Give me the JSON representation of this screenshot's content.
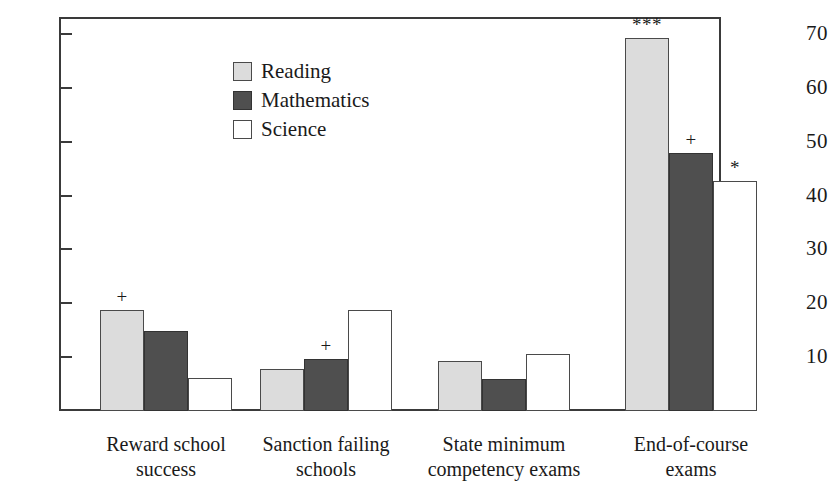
{
  "chart_data": {
    "type": "bar",
    "title": "",
    "subtitle": "",
    "xlabel": "",
    "ylabel": "",
    "ylim": [
      0,
      73
    ],
    "yticks": [
      10,
      20,
      30,
      40,
      50,
      60,
      70
    ],
    "grid": false,
    "legend_position": "inside-top-left",
    "categories": [
      "Reward school success",
      "Sanction failing schools",
      "State minimum competency exams",
      "End-of-course exams"
    ],
    "category_lines": [
      [
        "Reward school",
        "success"
      ],
      [
        "Sanction failing",
        "schools"
      ],
      [
        "State minimum",
        "competency exams"
      ],
      [
        "End-of-course",
        "exams"
      ]
    ],
    "series": [
      {
        "name": "Reading",
        "color": "#dcdcdc",
        "values": [
          18.8,
          7.8,
          9.3,
          69.3
        ],
        "annotations": [
          "+",
          "",
          "",
          "***"
        ]
      },
      {
        "name": "Mathematics",
        "color": "#4f4f4f",
        "values": [
          14.9,
          9.7,
          5.9,
          47.9
        ],
        "annotations": [
          "",
          "+",
          "",
          "+"
        ]
      },
      {
        "name": "Science",
        "color": "#ffffff",
        "values": [
          6.1,
          18.8,
          10.6,
          42.7
        ],
        "annotations": [
          "",
          "",
          "",
          "*"
        ]
      }
    ]
  },
  "legend": {
    "items": [
      {
        "label": "Reading",
        "swatch": "light-gray-swatch"
      },
      {
        "label": "Mathematics",
        "swatch": "dark-gray-swatch"
      },
      {
        "label": "Science",
        "swatch": "white-swatch"
      }
    ]
  },
  "axis": {
    "y_tick_labels": [
      "70",
      "60",
      "50",
      "40",
      "30",
      "20",
      "10"
    ]
  },
  "colors": {
    "reading": "#dcdcdc",
    "mathematics": "#4f4f4f",
    "science": "#ffffff",
    "axis": "#3a3a3a",
    "text": "#1a1a1a"
  }
}
